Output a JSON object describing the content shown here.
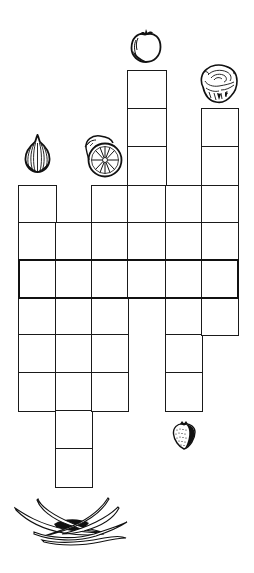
{
  "puzzle": {
    "type": "picture-crossword",
    "theme": "fruits-and-vegetables",
    "colors": {
      "line": "#1a1a1a",
      "background": "#ffffff"
    },
    "col_x": [
      19,
      56,
      92,
      128,
      166,
      202,
      238
    ],
    "row_y": [
      71,
      109,
      147,
      186,
      223,
      260,
      298,
      335,
      373,
      411,
      449,
      487
    ],
    "highlight_row": {
      "row_top": 260,
      "row_bottom": 298,
      "label": "solution-row"
    },
    "columns": [
      {
        "index": 0,
        "clue_icon": "onion-icon",
        "top_row": 3,
        "bottom_row": 9,
        "cells": 6
      },
      {
        "index": 1,
        "clue_icon": "green-beans-icon",
        "top_row": 4,
        "bottom_row": 11,
        "cells": 7
      },
      {
        "index": 2,
        "clue_icon": "orange-icon",
        "top_row": 3,
        "bottom_row": 9,
        "cells": 6
      },
      {
        "index": 3,
        "clue_icon": "tomato-icon",
        "top_row": 0,
        "bottom_row": 6,
        "cells": 6
      },
      {
        "index": 4,
        "clue_icon": "strawberry-icon",
        "top_row": 3,
        "bottom_row": 9,
        "cells": 6
      },
      {
        "index": 5,
        "clue_icon": "lettuce-icon",
        "top_row": 1,
        "bottom_row": 7,
        "cells": 6
      }
    ],
    "icons": [
      {
        "name": "onion-icon",
        "x": 24,
        "y": 134,
        "w": 27,
        "h": 39
      },
      {
        "name": "orange-icon",
        "x": 82,
        "y": 134,
        "w": 41,
        "h": 44
      },
      {
        "name": "tomato-icon",
        "x": 130,
        "y": 27,
        "w": 32,
        "h": 36
      },
      {
        "name": "lettuce-icon",
        "x": 199,
        "y": 63,
        "w": 40,
        "h": 41
      },
      {
        "name": "strawberry-icon",
        "x": 172,
        "y": 420,
        "w": 24,
        "h": 30
      },
      {
        "name": "green-beans-icon",
        "x": 14,
        "y": 496,
        "w": 114,
        "h": 52
      }
    ]
  }
}
